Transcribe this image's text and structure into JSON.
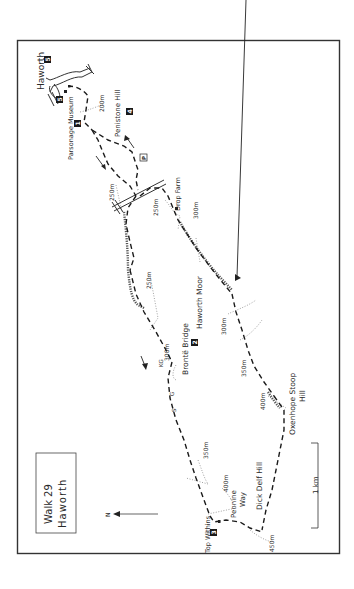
{
  "map": {
    "title_line1": "Walk 29",
    "title_line2": "Haworth",
    "north_label": "N",
    "scale_label": "1 km",
    "colors": {
      "frame": "#333333",
      "route": "#1a1a1a",
      "contour": "#8a8a8a",
      "waypoint_fill": "#1a1a1a",
      "waypoint_text": "#ffffff"
    },
    "places": {
      "haworth": "Haworth",
      "parsonage_museum": "Parsonage Museum",
      "penistone_hill": "Penistone Hill",
      "drop_farm": "Drop Farm",
      "haworth_moor": "Haworth Moor",
      "bronte_bridge": "Brontë Bridge",
      "oxenhope_stoop_hill_1": "Oxenhope Stoop",
      "oxenhope_stoop_hill_2": "Hill",
      "top_withins": "Top Withins",
      "pennine_way_1": "Pennine",
      "pennine_way_2": "Way",
      "dick_delf_hill": "Dick Delf Hill"
    },
    "gates": {
      "kg": "KG",
      "g": "G",
      "s": "S"
    },
    "parking": "P",
    "waypoints": [
      "1",
      "2",
      "3",
      "4",
      "5",
      "5"
    ],
    "contours": {
      "c200": "200m",
      "c250a": "250m",
      "c250b": "250m",
      "c250c": "250m",
      "c300a": "300m",
      "c300b": "300m",
      "c300c": "300m",
      "c350a": "350m",
      "c350b": "350m",
      "c400a": "400m",
      "c400b": "400m",
      "c450": "450m"
    }
  }
}
